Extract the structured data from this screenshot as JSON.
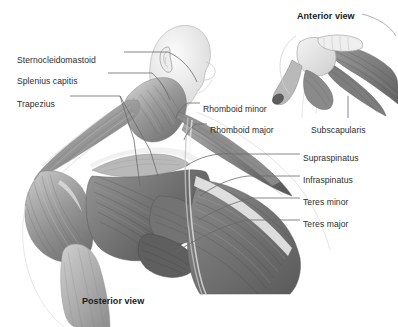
{
  "figure": {
    "title_main": "Posterior view",
    "title_inset": "Anterior view",
    "background_color": "#ffffff",
    "label_color": "#2d2d2d",
    "leader_color": "#6b6b6b",
    "muscle_tone_dark": "#5f5f5f",
    "muscle_tone_mid": "#8a8a8a",
    "muscle_tone_light": "#c9c9c9",
    "skin_tone": "#ededed",
    "bone_tone": "#e4e4e4"
  },
  "labels_left": [
    {
      "id": "sternocleidomastoid",
      "text": "Sternocleidomastoid",
      "x": 17,
      "y": 55
    },
    {
      "id": "splenius-capitis",
      "text": "Splenius capitis",
      "x": 17,
      "y": 76
    },
    {
      "id": "trapezius",
      "text": "Trapezius",
      "x": 17,
      "y": 99
    }
  ],
  "labels_right_upper": [
    {
      "id": "rhomboid-minor",
      "text": "Rhomboid minor",
      "x": 203,
      "y": 104
    },
    {
      "id": "rhomboid-major",
      "text": "Rhomboid major",
      "x": 210,
      "y": 125
    }
  ],
  "labels_right": [
    {
      "id": "supraspinatus",
      "text": "Supraspinatus",
      "x": 303,
      "y": 153
    },
    {
      "id": "infraspinatus",
      "text": "Infraspinatus",
      "x": 303,
      "y": 175
    },
    {
      "id": "teres-minor",
      "text": "Teres minor",
      "x": 303,
      "y": 197
    },
    {
      "id": "teres-major",
      "text": "Teres major",
      "x": 303,
      "y": 219
    }
  ],
  "labels_inset": [
    {
      "id": "subscapularis",
      "text": "Subscapularis",
      "x": 311,
      "y": 125
    }
  ],
  "captions": [
    {
      "id": "posterior-view",
      "text": "Posterior view",
      "x": 82,
      "y": 296
    },
    {
      "id": "anterior-view",
      "text": "Anterior view",
      "x": 297,
      "y": 11
    }
  ]
}
